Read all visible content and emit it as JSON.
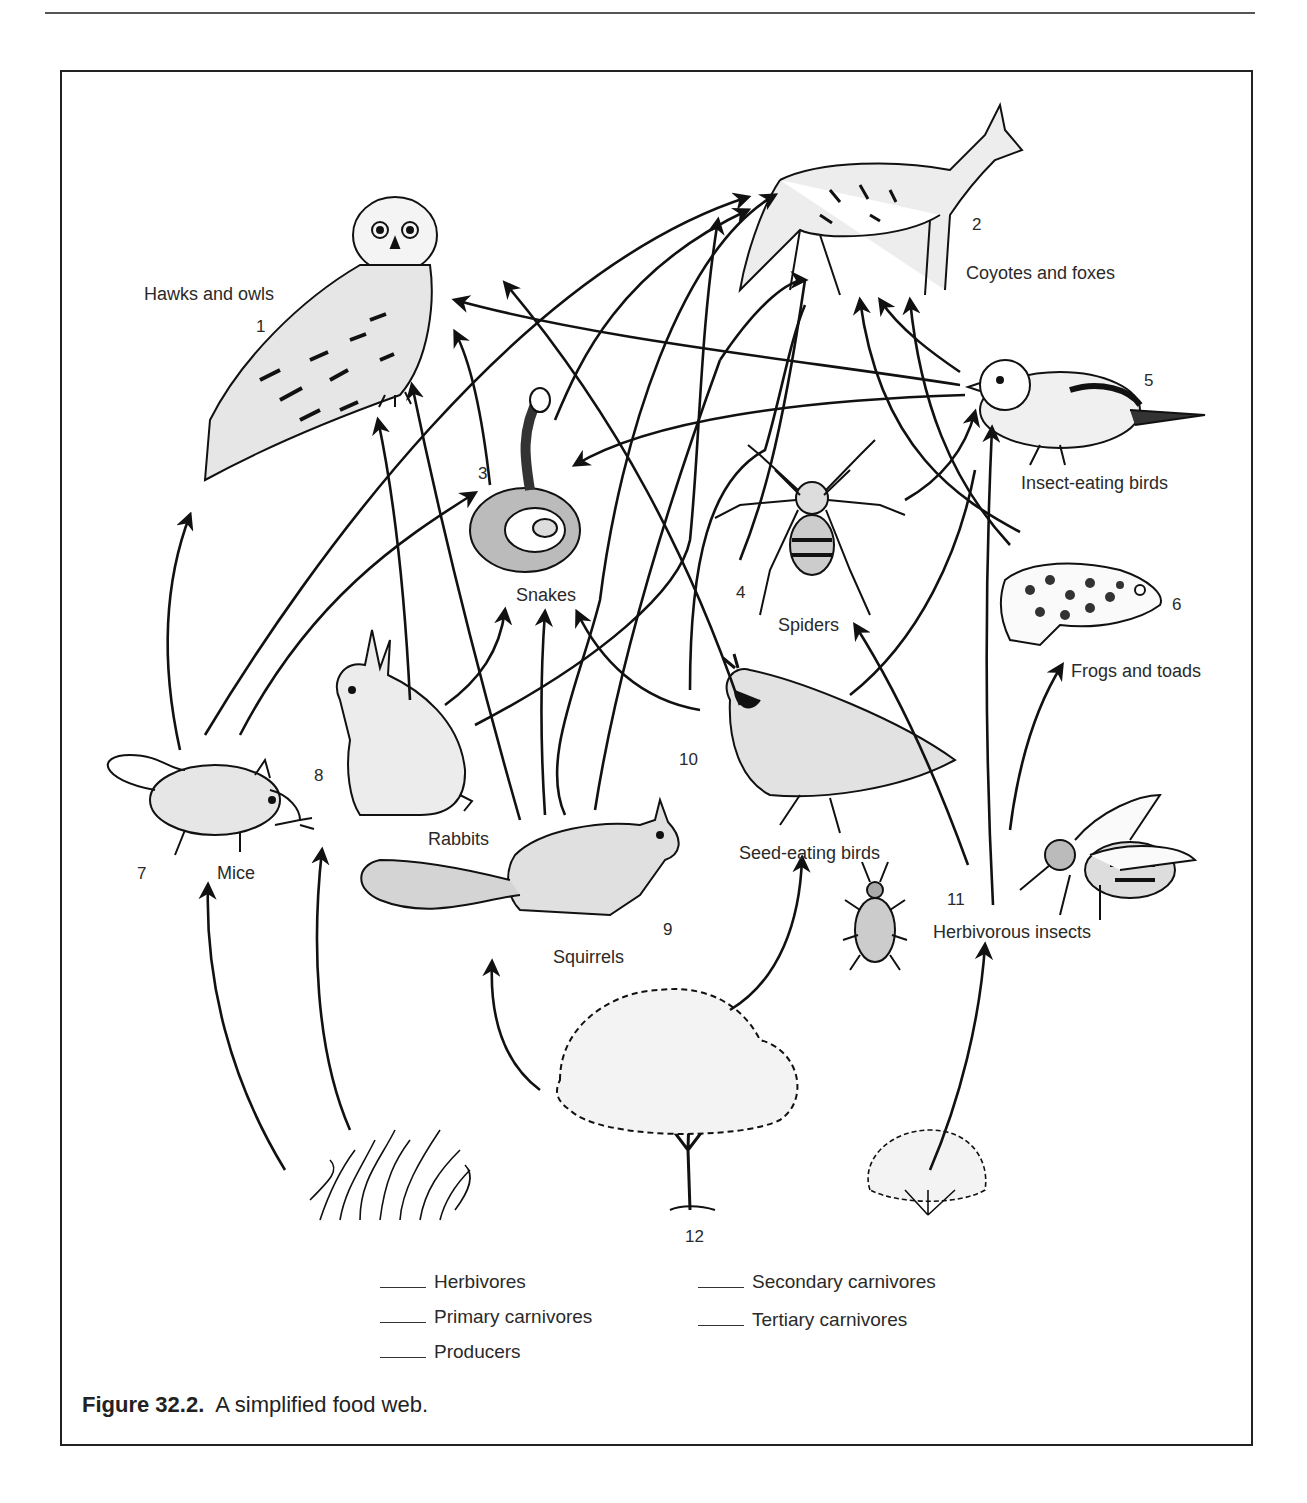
{
  "figure": {
    "caption_label": "Figure 32.2.",
    "caption_text": "A simplified food web."
  },
  "organisms": [
    {
      "id": 1,
      "number": "1",
      "label": "Hawks and owls",
      "icon": "owl-icon"
    },
    {
      "id": 2,
      "number": "2",
      "label": "Coyotes and foxes",
      "icon": "coyote-icon"
    },
    {
      "id": 3,
      "number": "3",
      "label": "Snakes",
      "icon": "snake-icon"
    },
    {
      "id": 4,
      "number": "4",
      "label": "Spiders",
      "icon": "spider-icon"
    },
    {
      "id": 5,
      "number": "5",
      "label": "Insect-eating birds",
      "icon": "songbird-icon"
    },
    {
      "id": 6,
      "number": "6",
      "label": "Frogs and toads",
      "icon": "frog-icon"
    },
    {
      "id": 7,
      "number": "7",
      "label": "Mice",
      "icon": "mouse-icon"
    },
    {
      "id": 8,
      "number": "8",
      "label": "Rabbits",
      "icon": "rabbit-icon"
    },
    {
      "id": 9,
      "number": "9",
      "label": "Squirrels",
      "icon": "squirrel-icon"
    },
    {
      "id": 10,
      "number": "10",
      "label": "Seed-eating birds",
      "icon": "quail-icon"
    },
    {
      "id": 11,
      "number": "11",
      "label": "Herbivorous insects",
      "icon": "bee-beetle-icon"
    },
    {
      "id": 12,
      "number": "12",
      "label": "",
      "icon": "plants-icon"
    }
  ],
  "producers": [
    {
      "name": "grass",
      "icon": "grass-icon"
    },
    {
      "name": "tree",
      "icon": "tree-icon"
    },
    {
      "name": "shrub",
      "icon": "shrub-icon"
    }
  ],
  "legend": {
    "blank": "____",
    "items": [
      {
        "label": "Herbivores"
      },
      {
        "label": "Primary carnivores"
      },
      {
        "label": "Producers"
      },
      {
        "label": "Secondary carnivores"
      },
      {
        "label": "Tertiary carnivores"
      }
    ]
  },
  "links": [
    {
      "from": "grass",
      "to": 7
    },
    {
      "from": "grass",
      "to": 8
    },
    {
      "from": "tree",
      "to": 9
    },
    {
      "from": "tree",
      "to": 10
    },
    {
      "from": "shrub",
      "to": 11
    },
    {
      "from": 7,
      "to": 1
    },
    {
      "from": 7,
      "to": 2
    },
    {
      "from": 7,
      "to": 3
    },
    {
      "from": 8,
      "to": 1
    },
    {
      "from": 8,
      "to": 2
    },
    {
      "from": 8,
      "to": 3
    },
    {
      "from": 9,
      "to": 1
    },
    {
      "from": 9,
      "to": 2
    },
    {
      "from": 9,
      "to": 3
    },
    {
      "from": 10,
      "to": 1
    },
    {
      "from": 10,
      "to": 2
    },
    {
      "from": 10,
      "to": 3
    },
    {
      "from": 3,
      "to": 1
    },
    {
      "from": 3,
      "to": 2
    },
    {
      "from": 4,
      "to": 5
    },
    {
      "from": 4,
      "to": 2
    },
    {
      "from": 5,
      "to": 1
    },
    {
      "from": 5,
      "to": 2
    },
    {
      "from": 5,
      "to": 3
    },
    {
      "from": 6,
      "to": 2
    },
    {
      "from": 11,
      "to": 4
    },
    {
      "from": 11,
      "to": 5
    },
    {
      "from": 11,
      "to": 6
    }
  ],
  "colors": {
    "ink": "#222222",
    "background": "#ffffff"
  }
}
